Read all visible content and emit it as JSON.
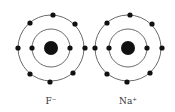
{
  "atoms": [
    {
      "label": "F⁻",
      "cx": 51,
      "cy": 48,
      "outer_electrons": 8,
      "inner_electrons": 2
    },
    {
      "label": "Na⁺",
      "cx": 128,
      "cy": 48,
      "outer_electrons": 8,
      "inner_electrons": 2
    }
  ]
}
